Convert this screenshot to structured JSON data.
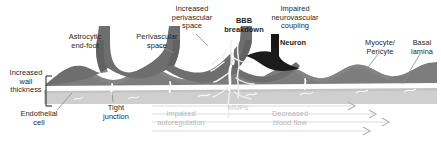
{
  "figure": {
    "width": 441,
    "height": 142,
    "background": "#ffffff"
  },
  "palette": {
    "text": "#231f20",
    "faint_text": "#b8b8b8",
    "astrocyte": "#6e6e6e",
    "astrocyte_dark": "#5d5d5d",
    "myocyte": "#7d7d7d",
    "neuron": "#1b1b1b",
    "basal_lamina": "#ffffff",
    "endothelium": "#cfcfcf",
    "leader_line": "#8a8a8a",
    "flow_arrow": "#dcdcdc",
    "leak": "#f2f2f2"
  },
  "labels": [
    {
      "id": "astrocytic-end-foot",
      "text": "Astrocytic\nend-foot",
      "x": 57,
      "y": 33,
      "w": 56,
      "bold": false,
      "faint": false
    },
    {
      "id": "perivascular-space",
      "text": "Perivascular\nspace",
      "x": 127,
      "y": 33,
      "w": 60,
      "bold": false,
      "faint": false
    },
    {
      "id": "increased-perivascular-space",
      "text": "Increased\nperivascular\nspace",
      "x": 161,
      "y": 5,
      "w": 62,
      "bold": false,
      "faint": false
    },
    {
      "id": "bbb-breakdown",
      "text": "BBB\nbreakdown",
      "x": 216,
      "y": 17,
      "w": 56,
      "bold": true,
      "faint": false
    },
    {
      "id": "impaired-neurovascular-coupling",
      "text": "Impaired\nneurovascular\ncoupling",
      "x": 258,
      "y": 5,
      "w": 74,
      "bold": false,
      "faint": false
    },
    {
      "id": "neuron",
      "text": "Neuron",
      "x": 273,
      "y": 39,
      "w": 40,
      "bold": true,
      "faint": false
    },
    {
      "id": "myocyte-pericyte",
      "text": "Myocyte/\nPericyte",
      "x": 357,
      "y": 39,
      "w": 46,
      "bold": false,
      "faint": false
    },
    {
      "id": "basal-lamina",
      "text": "Basal\nlamina",
      "x": 404,
      "y": 39,
      "w": 36,
      "bold": false,
      "faint": false
    },
    {
      "id": "increased-wall-thickness",
      "text": "Increased\nwall\nthickness",
      "x": 3,
      "y": 69,
      "w": 46,
      "bold": false,
      "faint": false
    },
    {
      "id": "endothelial-cell",
      "text": "Endothelial\ncell",
      "x": 14,
      "y": 110,
      "w": 50,
      "bold": false,
      "faint": false
    },
    {
      "id": "tight-junction",
      "text": "Tight\njunction",
      "x": 95,
      "y": 104,
      "w": 42,
      "bold": false,
      "faint": false
    },
    {
      "id": "impaired-autoregulation",
      "text": "Impaired\nautoregulation",
      "x": 146,
      "y": 110,
      "w": 70,
      "bold": false,
      "faint": true
    },
    {
      "id": "mmps",
      "text": "MMPs",
      "x": 224,
      "y": 104,
      "w": 28,
      "bold": false,
      "faint": true
    },
    {
      "id": "decreased-blood-flow",
      "text": "Decreased\nblood flow",
      "x": 262,
      "y": 110,
      "w": 56,
      "bold": false,
      "faint": true
    }
  ],
  "flow_arrows": [
    {
      "id": "flow-arrow-1",
      "y": 106,
      "x1": 152,
      "x2": 354
    },
    {
      "id": "flow-arrow-2",
      "y": 114,
      "x1": 152,
      "x2": 375
    },
    {
      "id": "flow-arrow-3",
      "y": 122,
      "x1": 152,
      "x2": 388
    },
    {
      "id": "flow-arrow-4",
      "y": 131,
      "x1": 152,
      "x2": 369
    }
  ],
  "structures": [
    {
      "id": "vessel-wall",
      "name": "vessel-wall"
    },
    {
      "id": "astrocyte-layer",
      "name": "astrocyte-end-foot-layer"
    },
    {
      "id": "myocyte-layer",
      "name": "myocyte-pericyte-layer"
    },
    {
      "id": "endothelium-layer",
      "name": "endothelial-cell-layer"
    },
    {
      "id": "neuron-body",
      "name": "neuron-body"
    },
    {
      "id": "bbb-leak",
      "name": "bbb-breakdown-leakage"
    },
    {
      "id": "wall-bracket",
      "name": "wall-thickness-bracket"
    }
  ]
}
